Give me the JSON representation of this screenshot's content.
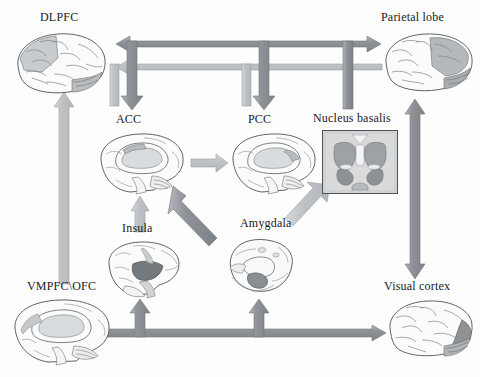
{
  "figure": {
    "background_color": "#fdfdfd",
    "arrow_dark_color": "#8d9196",
    "arrow_light_color": "#bcbfc2",
    "outline_color": "#6f7478",
    "label_color": "#1a1a1a"
  },
  "nodes": [
    {
      "id": "dlpfc",
      "label": "DLPFC",
      "kind": "lateral-brain",
      "x": 12,
      "y": 28,
      "w": 98,
      "h": 72,
      "label_x": 40,
      "label_y": 10,
      "highlight": "frontal"
    },
    {
      "id": "parietal",
      "label": "Parietal lobe",
      "kind": "lateral-brain",
      "x": 382,
      "y": 28,
      "w": 94,
      "h": 70,
      "label_x": 381,
      "label_y": 10,
      "highlight": "parietal"
    },
    {
      "id": "acc",
      "label": "ACC",
      "kind": "medial-brain",
      "x": 96,
      "y": 130,
      "w": 92,
      "h": 68,
      "label_x": 116,
      "label_y": 112,
      "highlight": "acc"
    },
    {
      "id": "pcc",
      "label": "PCC",
      "kind": "medial-brain",
      "x": 228,
      "y": 130,
      "w": 92,
      "h": 68,
      "label_x": 248,
      "label_y": 112,
      "highlight": "pcc"
    },
    {
      "id": "nucleus_basalis",
      "label": "Nucleus basalis",
      "kind": "coronal-section",
      "x": 322,
      "y": 130,
      "w": 76,
      "h": 64,
      "label_x": 313,
      "label_y": 111,
      "highlight": "basal-forebrain"
    },
    {
      "id": "insula",
      "label": "Insula",
      "kind": "insula-brain",
      "x": 105,
      "y": 238,
      "w": 78,
      "h": 64,
      "label_x": 122,
      "label_y": 221,
      "highlight": "insula"
    },
    {
      "id": "amygdala",
      "label": "Amygdala",
      "kind": "amygdala-slice",
      "x": 222,
      "y": 233,
      "w": 78,
      "h": 68,
      "label_x": 240,
      "label_y": 216,
      "highlight": "amygdala"
    },
    {
      "id": "vmpfc_ofc",
      "label": "VMPFC\\OFC",
      "kind": "medial-brain",
      "x": 10,
      "y": 296,
      "w": 104,
      "h": 72,
      "label_x": 27,
      "label_y": 279,
      "highlight": "vmpfc"
    },
    {
      "id": "visual_cortex",
      "label": "Visual cortex",
      "kind": "lateral-brain",
      "x": 386,
      "y": 296,
      "w": 90,
      "h": 66,
      "label_x": 384,
      "label_y": 279,
      "highlight": "occipital"
    }
  ],
  "connections": [
    {
      "id": "bus-top",
      "from": "parietal",
      "to": "dlpfc",
      "style": "dark",
      "heads": "both",
      "kind": "horizontal-bus"
    },
    {
      "id": "bus-second",
      "from": "parietal",
      "to": "dlpfc",
      "style": "light",
      "heads": "left",
      "kind": "horizontal-bus"
    },
    {
      "id": "bus-acc-down",
      "from": "bus-top",
      "to": "acc",
      "style": "dark",
      "heads": "down",
      "kind": "vertical-branch"
    },
    {
      "id": "bus-acc-up",
      "from": "acc",
      "to": "bus-second",
      "style": "light",
      "heads": "none",
      "kind": "vertical-branch"
    },
    {
      "id": "bus-pcc-down",
      "from": "bus-top",
      "to": "pcc",
      "style": "dark",
      "heads": "down",
      "kind": "vertical-branch"
    },
    {
      "id": "bus-pcc-up",
      "from": "pcc",
      "to": "bus-second",
      "style": "light",
      "heads": "none",
      "kind": "vertical-branch"
    },
    {
      "id": "bus-nb-down",
      "from": "bus-top",
      "to": "nucleus_basalis",
      "style": "dark",
      "heads": "none",
      "kind": "vertical-branch"
    },
    {
      "id": "vmpfc-dlpfc",
      "from": "vmpfc_ofc",
      "to": "dlpfc",
      "style": "light",
      "heads": "up",
      "kind": "vertical"
    },
    {
      "id": "acc-pcc",
      "from": "acc",
      "to": "pcc",
      "style": "light",
      "heads": "right",
      "kind": "horizontal"
    },
    {
      "id": "insula-acc",
      "from": "insula",
      "to": "acc",
      "style": "light",
      "heads": "up",
      "kind": "vertical"
    },
    {
      "id": "amygdala-acc",
      "from": "amygdala",
      "to": "acc",
      "style": "dark",
      "heads": "up",
      "kind": "diagonal"
    },
    {
      "id": "amygdala-nb",
      "from": "amygdala",
      "to": "nucleus_basalis",
      "style": "light",
      "heads": "up",
      "kind": "diagonal"
    },
    {
      "id": "parietal-visual",
      "from": "parietal",
      "to": "visual_cortex",
      "style": "dark",
      "heads": "both",
      "kind": "vertical"
    },
    {
      "id": "bottom-bus",
      "from": "vmpfc_ofc",
      "to": "visual_cortex",
      "style": "dark",
      "heads": "both",
      "kind": "horizontal-bus"
    },
    {
      "id": "bottom-insula",
      "from": "bottom-bus",
      "to": "insula",
      "style": "dark",
      "heads": "up",
      "kind": "vertical-branch"
    },
    {
      "id": "bottom-amyg",
      "from": "bottom-bus",
      "to": "amygdala",
      "style": "dark",
      "heads": "up",
      "kind": "vertical-branch"
    }
  ]
}
